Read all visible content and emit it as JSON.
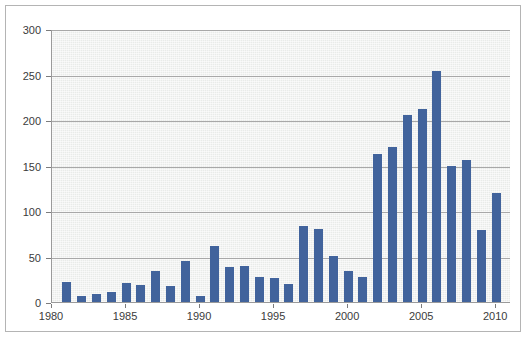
{
  "chart_data": {
    "type": "bar",
    "title": "",
    "subtitle": "",
    "xlabel": "",
    "ylabel": "",
    "xlim": [
      1980,
      2011
    ],
    "ylim": [
      0,
      300
    ],
    "grid": true,
    "legend": null,
    "bar_color": "#41639c",
    "plot_background": "#e9ebe9",
    "gridline_color": "#a8a8a8",
    "axis_color": "#9a9a9a",
    "frame_color": "#b4b4b4",
    "ytick_labels": [
      "0",
      "50",
      "100",
      "150",
      "200",
      "250",
      "300"
    ],
    "ytick_values": [
      0,
      50,
      100,
      150,
      200,
      250,
      300
    ],
    "xtick_labels": [
      "1980",
      "1985",
      "1990",
      "1995",
      "2000",
      "2005",
      "2010"
    ],
    "xtick_values": [
      1980,
      1985,
      1990,
      1995,
      2000,
      2005,
      2010
    ],
    "categories": [
      1981,
      1982,
      1983,
      1984,
      1985,
      1986,
      1987,
      1988,
      1989,
      1990,
      1991,
      1992,
      1993,
      1994,
      1995,
      1996,
      1997,
      1998,
      1999,
      2000,
      2001,
      2002,
      2003,
      2004,
      2005,
      2006,
      2007,
      2008,
      2009,
      2010,
      2011
    ],
    "values": [
      22,
      7,
      9,
      11,
      21,
      19,
      34,
      18,
      45,
      7,
      62,
      38,
      40,
      28,
      26,
      20,
      84,
      80,
      51,
      34,
      28,
      163,
      170,
      205,
      212,
      254,
      150,
      156,
      79,
      120,
      0
    ]
  }
}
